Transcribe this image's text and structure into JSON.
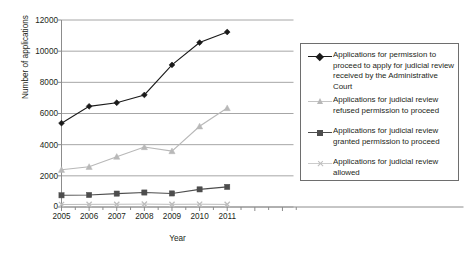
{
  "chart_data": {
    "type": "line",
    "title": "",
    "subtitle": "",
    "xlabel": "Year",
    "ylabel": "Number of applications",
    "categories": [
      2005,
      2006,
      2007,
      2008,
      2009,
      2010,
      2011
    ],
    "x_tick_labels": [
      "2005",
      "2006",
      "2007",
      "2008",
      "2009",
      "2010",
      "2011"
    ],
    "y_tick_labels": [
      "0",
      "2000",
      "4000",
      "6000",
      "8000",
      "10000",
      "12000"
    ],
    "y_ticks": [
      0,
      2000,
      4000,
      6000,
      8000,
      10000,
      12000
    ],
    "ylim": [
      0,
      12000
    ],
    "xlim": [
      2005,
      2013.4
    ],
    "grid": "horizontal",
    "legend_position": "right",
    "series": [
      {
        "name": "Applications for permission to proceed to apply for judicial review received by the Administrative Court",
        "marker": "diamond",
        "color": "#1a1a1a",
        "values": [
          5380,
          6460,
          6690,
          7190,
          9120,
          10550,
          11230
        ]
      },
      {
        "name": "Applications for judicial review refused permission to proceed",
        "marker": "triangle",
        "color": "#b8b8b8",
        "values": [
          2390,
          2580,
          3230,
          3850,
          3590,
          5180,
          6350
        ]
      },
      {
        "name": "Applications for judicial review granted permission to proceed",
        "marker": "square",
        "color": "#4d4d4d",
        "values": [
          750,
          770,
          860,
          930,
          870,
          1130,
          1290
        ]
      },
      {
        "name": "Applications for judicial review allowed",
        "marker": "x",
        "color": "#bdbdbd",
        "values": [
          160,
          170,
          175,
          185,
          170,
          180,
          165
        ]
      }
    ]
  },
  "legend": {
    "entries": [
      {
        "label": "Applications for permission to proceed to apply for judicial review received by the Administrative Court",
        "marker": "diamond-marker-icon"
      },
      {
        "label": "Applications for judicial review refused permission to proceed",
        "marker": "triangle-marker-icon"
      },
      {
        "label": "Applications for judicial review granted permission to proceed",
        "marker": "square-marker-icon"
      },
      {
        "label": "Applications for judicial review allowed",
        "marker": "x-marker-icon"
      }
    ]
  },
  "colors": {
    "series_black": "#1a1a1a",
    "series_light_gray": "#b8b8b8",
    "series_dark_gray": "#4d4d4d",
    "series_pale_gray": "#bdbdbd",
    "grid": "#a6a6a6",
    "axis": "#8c8c8c",
    "text": "#231f20",
    "background": "#ffffff"
  }
}
